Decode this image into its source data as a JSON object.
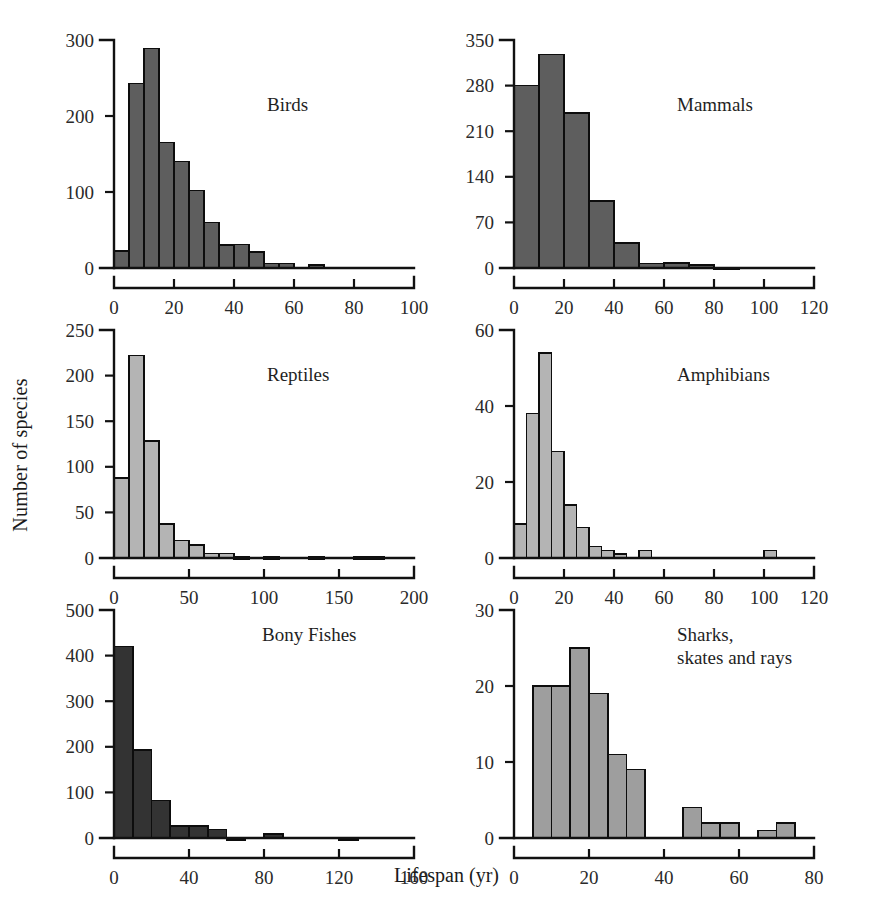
{
  "figure": {
    "x_axis_title": "Lifespan (yr)",
    "y_axis_title": "Number of species",
    "background": "#ffffff"
  },
  "chart_data": [
    {
      "type": "bar",
      "id": "birds",
      "title": "Birds",
      "xlabel": "Lifespan (yr)",
      "ylabel": "Number of species",
      "bin_width": 5,
      "xlim": [
        0,
        100
      ],
      "ylim": [
        0,
        300
      ],
      "xticks": [
        0,
        20,
        40,
        60,
        80,
        100
      ],
      "yticks": [
        0,
        100,
        200,
        300
      ],
      "grid": false,
      "bar_color": "#5e5e5e",
      "bin_starts": [
        0,
        5,
        10,
        15,
        20,
        25,
        30,
        35,
        40,
        45,
        50,
        55,
        60,
        65,
        70,
        75,
        80
      ],
      "values": [
        22,
        243,
        289,
        165,
        140,
        102,
        60,
        30,
        31,
        21,
        6,
        6,
        0,
        4,
        0,
        0,
        0
      ]
    },
    {
      "type": "bar",
      "id": "mammals",
      "title": "Mammals",
      "xlabel": "Lifespan (yr)",
      "ylabel": "Number of species",
      "bin_width": 10,
      "xlim": [
        0,
        120
      ],
      "ylim": [
        0,
        350
      ],
      "xticks": [
        0,
        20,
        40,
        60,
        80,
        100,
        120
      ],
      "yticks": [
        0,
        70,
        140,
        210,
        280,
        350
      ],
      "grid": false,
      "bar_color": "#5e5e5e",
      "bin_starts": [
        0,
        10,
        20,
        30,
        40,
        50,
        60,
        70,
        80,
        90,
        100,
        110
      ],
      "values": [
        280,
        328,
        238,
        103,
        38,
        7,
        8,
        5,
        1,
        0,
        0,
        0
      ]
    },
    {
      "type": "bar",
      "id": "reptiles",
      "title": "Reptiles",
      "xlabel": "Lifespan (yr)",
      "ylabel": "Number of species",
      "bin_width": 10,
      "xlim": [
        0,
        200
      ],
      "ylim": [
        0,
        250
      ],
      "xticks": [
        0,
        50,
        100,
        150,
        200
      ],
      "yticks": [
        0,
        50,
        100,
        150,
        200,
        250
      ],
      "grid": false,
      "bar_color": "#b4b4b4",
      "bin_starts": [
        0,
        10,
        20,
        30,
        40,
        50,
        60,
        70,
        80,
        90,
        100,
        110,
        120,
        130,
        140,
        150,
        160,
        170
      ],
      "values": [
        88,
        222,
        128,
        37,
        19,
        14,
        5,
        5,
        1,
        0,
        1,
        0,
        0,
        1,
        0,
        0,
        1,
        1
      ]
    },
    {
      "type": "bar",
      "id": "amphibians",
      "title": "Amphibians",
      "xlabel": "Lifespan (yr)",
      "ylabel": "Number of species",
      "bin_width": 5,
      "xlim": [
        0,
        120
      ],
      "ylim": [
        0,
        60
      ],
      "xticks": [
        0,
        20,
        40,
        60,
        80,
        100,
        120
      ],
      "yticks": [
        0,
        20,
        40,
        60
      ],
      "grid": false,
      "bar_color": "#b4b4b4",
      "bin_starts": [
        0,
        5,
        10,
        15,
        20,
        25,
        30,
        35,
        40,
        45,
        50,
        55,
        60,
        65,
        70,
        75,
        80,
        85,
        90,
        95,
        100
      ],
      "values": [
        9,
        38,
        54,
        28,
        14,
        8,
        3,
        2,
        1,
        0,
        2,
        0,
        0,
        0,
        0,
        0,
        0,
        0,
        0,
        0,
        2
      ]
    },
    {
      "type": "bar",
      "id": "bony-fishes",
      "title": "Bony Fishes",
      "xlabel": "Lifespan (yr)",
      "ylabel": "Number of species",
      "bin_width": 10,
      "xlim": [
        0,
        160
      ],
      "ylim": [
        0,
        500
      ],
      "xticks": [
        0,
        40,
        80,
        120,
        160
      ],
      "yticks": [
        0,
        100,
        200,
        300,
        400,
        500
      ],
      "grid": false,
      "bar_color": "#333333",
      "bin_starts": [
        0,
        10,
        20,
        30,
        40,
        50,
        60,
        70,
        80,
        90,
        100,
        110,
        120,
        130,
        140,
        150
      ],
      "values": [
        420,
        193,
        82,
        26,
        26,
        19,
        1,
        0,
        9,
        0,
        0,
        0,
        1,
        0,
        0,
        0
      ]
    },
    {
      "type": "bar",
      "id": "sharks-skates-rays",
      "title": "Sharks,\nskates and rays",
      "xlabel": "Lifespan (yr)",
      "ylabel": "Number of species",
      "bin_width": 5,
      "xlim": [
        0,
        80
      ],
      "ylim": [
        0,
        30
      ],
      "xticks": [
        0,
        20,
        40,
        60,
        80
      ],
      "yticks": [
        0,
        10,
        20,
        30
      ],
      "grid": false,
      "bar_color": "#9e9e9e",
      "bin_starts": [
        0,
        5,
        10,
        15,
        20,
        25,
        30,
        35,
        40,
        45,
        50,
        55,
        60,
        65,
        70
      ],
      "values": [
        0,
        20,
        20,
        25,
        19,
        11,
        9,
        0,
        0,
        4,
        2,
        2,
        0,
        1,
        2
      ]
    }
  ],
  "panels": [
    {
      "name": "panel-birds",
      "title_x": 205,
      "title_y": 65
    },
    {
      "name": "panel-mammals",
      "title_x": 215,
      "title_y": 65
    },
    {
      "name": "panel-reptiles",
      "title_x": 205,
      "title_y": 45
    },
    {
      "name": "panel-amphibians",
      "title_x": 215,
      "title_y": 45
    },
    {
      "name": "panel-bony-fishes",
      "title_x": 200,
      "title_y": 25
    },
    {
      "name": "panel-sharks-skates-rays",
      "title_x": 215,
      "title_y": 25
    }
  ]
}
